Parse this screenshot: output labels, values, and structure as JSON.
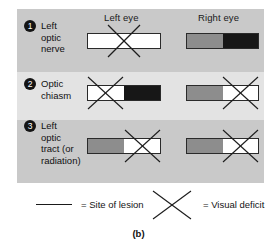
{
  "figure": {
    "caption": "(b)",
    "columns": [
      {
        "id": "left-eye",
        "label": "Left eye"
      },
      {
        "id": "right-eye",
        "label": "Right eye"
      }
    ],
    "rows": [
      {
        "number": "1",
        "label": "Left optic nerve",
        "label_lines": [
          "Left",
          "optic",
          "nerve"
        ],
        "left_eye": {
          "halves": [
            "white",
            "white"
          ],
          "deficit": "full"
        },
        "right_eye": {
          "halves": [
            "gray",
            "black"
          ],
          "deficit": "none"
        }
      },
      {
        "number": "2",
        "label": "Optic chiasm",
        "label_lines": [
          "Optic",
          "chiasm"
        ],
        "left_eye": {
          "halves": [
            "white",
            "black"
          ],
          "deficit": "left-half"
        },
        "right_eye": {
          "halves": [
            "gray",
            "white"
          ],
          "deficit": "right-half"
        }
      },
      {
        "number": "3",
        "label": "Left optic tract (or radiation)",
        "label_lines": [
          "Left",
          "optic",
          "tract (or",
          "radiation)"
        ],
        "left_eye": {
          "halves": [
            "gray",
            "white"
          ],
          "deficit": "right-half"
        },
        "right_eye": {
          "halves": [
            "gray",
            "white"
          ],
          "deficit": "right-half"
        }
      }
    ],
    "legend": {
      "site_of_lesion": "= Site of lesion",
      "visual_deficit": "= Visual deficit",
      "line_icon": "horizontal-line-icon",
      "x_icon": "x-cross-icon"
    },
    "colors": {
      "panel_dark_band": "#c9c9c9",
      "panel_light_band": "#e3e3e3",
      "field_white": "#ffffff",
      "field_gray": "#8d8d8d",
      "field_black": "#171717",
      "ink": "#141414",
      "page_background": "#ffffff"
    }
  }
}
